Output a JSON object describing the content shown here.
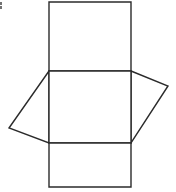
{
  "figure": {
    "background_color": "#ffffff",
    "stroke_color": "#2b2b2b",
    "fill_color": "#ffffff",
    "stroke_width": 1.4,
    "canvas": {
      "width": 176,
      "height": 192
    },
    "artifact": {
      "name": "edge-speck",
      "color": "#5a5a5a",
      "x": 0,
      "y": 2,
      "width": 2,
      "height": 7
    },
    "vertices": {
      "top_left": [
        49,
        2
      ],
      "top_right": [
        131,
        2
      ],
      "mid_upper_left": [
        49,
        71
      ],
      "mid_upper_right": [
        131,
        71
      ],
      "mid_lower_left": [
        49,
        143
      ],
      "mid_lower_right": [
        131,
        143
      ],
      "bottom_left": [
        49,
        187
      ],
      "bottom_right": [
        131,
        187
      ],
      "left_flap_apex": [
        9,
        128
      ],
      "right_flap_apex": [
        168,
        86
      ]
    },
    "faces": [
      {
        "name": "top-face",
        "shape": "rectangle",
        "points": "49,2 131,2 131,71 49,71"
      },
      {
        "name": "left-flap-face",
        "shape": "triangle-flap",
        "points": "49,71 9,128 49,143"
      },
      {
        "name": "right-flap-face",
        "shape": "triangle-flap",
        "points": "131,71 168,86 131,143"
      },
      {
        "name": "middle-face",
        "shape": "rectangle",
        "points": "49,71 131,71 131,143 49,143"
      },
      {
        "name": "bottom-face",
        "shape": "rectangle",
        "points": "49,143 131,143 131,187 49,187"
      }
    ]
  }
}
